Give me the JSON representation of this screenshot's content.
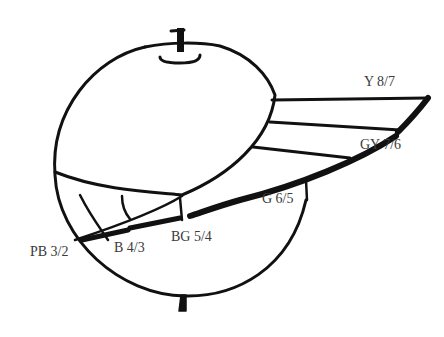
{
  "diagram": {
    "type": "color-solid-sketch",
    "stroke_color": "#111111",
    "label_color": "#3a3a3a",
    "labels": [
      {
        "id": "y",
        "text": "Y 8/7",
        "x": 364,
        "y": 75
      },
      {
        "id": "gy",
        "text": "GY 7/6",
        "x": 360,
        "y": 138
      },
      {
        "id": "g",
        "text": "G 6/5",
        "x": 262,
        "y": 192
      },
      {
        "id": "bg",
        "text": "BG 5/4",
        "x": 171,
        "y": 230
      },
      {
        "id": "b",
        "text": "B 4/3",
        "x": 114,
        "y": 241
      },
      {
        "id": "pb",
        "text": "PB 3/2",
        "x": 30,
        "y": 245
      }
    ]
  }
}
